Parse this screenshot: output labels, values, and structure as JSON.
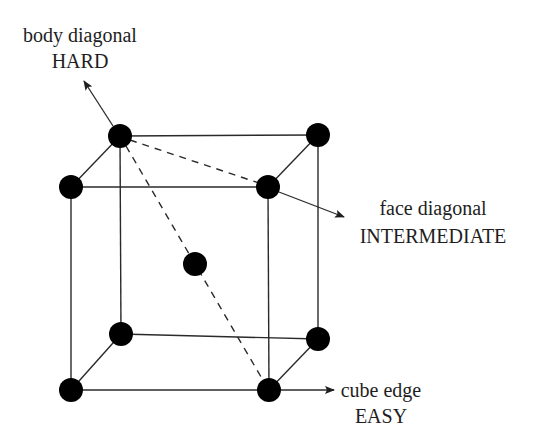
{
  "diagram": {
    "type": "bcc-unit-cell",
    "colors": {
      "atom": "#000000",
      "line": "#2a2a2a",
      "text": "#1e1e1e",
      "background": "#ffffff"
    },
    "atoms": [
      {
        "name": "back-top-left",
        "x": 120,
        "y": 136
      },
      {
        "name": "back-top-right",
        "x": 318,
        "y": 135
      },
      {
        "name": "front-top-left",
        "x": 71,
        "y": 187
      },
      {
        "name": "front-top-right",
        "x": 268,
        "y": 187
      },
      {
        "name": "body-center",
        "x": 195,
        "y": 264
      },
      {
        "name": "back-bottom-left",
        "x": 121,
        "y": 334
      },
      {
        "name": "back-bottom-right",
        "x": 318,
        "y": 339
      },
      {
        "name": "front-bottom-left",
        "x": 71,
        "y": 390
      },
      {
        "name": "front-bottom-right",
        "x": 269,
        "y": 390
      }
    ],
    "atom_radius": 12,
    "labels": {
      "body": {
        "line1": "body diagonal",
        "line2": "HARD"
      },
      "face": {
        "line1": "face diagonal",
        "line2": "INTERMEDIATE"
      },
      "edge": {
        "line1": "cube edge",
        "line2": "EASY"
      }
    }
  }
}
